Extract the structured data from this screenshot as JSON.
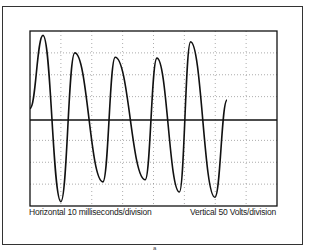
{
  "chart_data": {
    "type": "line",
    "title": "",
    "xlabel": "Horizontal 10 milliseconds/division",
    "ylabel": "Vertical 50 Volts/division",
    "grid": true,
    "grid_divisions": {
      "x": 8,
      "y": 8
    },
    "x_units": "ms",
    "y_units": "V",
    "x_range_ms": [
      0,
      80
    ],
    "y_range_volts": [
      -200,
      200
    ],
    "series": [
      {
        "name": "voltage",
        "points_ms_volts": [
          [
            0,
            23
          ],
          [
            4.2,
            190
          ],
          [
            10.0,
            -190
          ],
          [
            14.5,
            150
          ],
          [
            23.6,
            -145
          ],
          [
            27.6,
            140
          ],
          [
            37.3,
            -140
          ],
          [
            41.1,
            138
          ],
          [
            48.4,
            -168
          ],
          [
            52.0,
            175
          ],
          [
            59.9,
            -180
          ],
          [
            63.8,
            42
          ]
        ]
      }
    ]
  },
  "labels": {
    "horizontal": "Horizontal 10 milliseconds/division",
    "vertical": "Vertical 50 Volts/division",
    "page_mark": "a"
  }
}
